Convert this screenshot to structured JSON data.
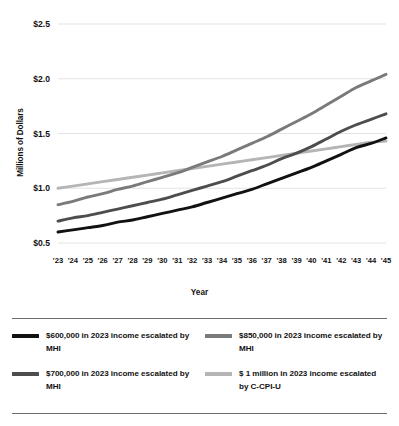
{
  "chart_data": {
    "type": "line",
    "title": "",
    "xlabel": "Year",
    "ylabel": "Millions of Dollars",
    "ylim": [
      0.5,
      2.5
    ],
    "ytick_labels": [
      "$2.5",
      "$2.0",
      "$1.5",
      "$1.0",
      "$0.5"
    ],
    "ytick_values": [
      2.5,
      2.0,
      1.5,
      1.0,
      0.5
    ],
    "grid": "horizontal",
    "legend_position": "bottom",
    "categories": [
      "'23",
      "'24",
      "'25",
      "'26",
      "'27",
      "'28",
      "'29",
      "'30",
      "'31",
      "'32",
      "'33",
      "'34",
      "'35",
      "'36",
      "'37",
      "'38",
      "'39",
      "'40",
      "'41",
      "'42",
      "'43",
      "'44",
      "'45"
    ],
    "x": [
      2023,
      2024,
      2025,
      2026,
      2027,
      2028,
      2029,
      2030,
      2031,
      2032,
      2033,
      2034,
      2035,
      2036,
      2037,
      2038,
      2039,
      2040,
      2041,
      2042,
      2043,
      2044,
      2045
    ],
    "series": [
      {
        "name": "$600,000 in 2023 income escalated by MHI",
        "color": "#111111",
        "values": [
          0.6,
          0.62,
          0.64,
          0.66,
          0.69,
          0.71,
          0.74,
          0.77,
          0.8,
          0.83,
          0.87,
          0.91,
          0.95,
          0.99,
          1.04,
          1.09,
          1.14,
          1.19,
          1.25,
          1.31,
          1.37,
          1.41,
          1.46
        ]
      },
      {
        "name": "$700,000 in 2023 income escalated by MHI",
        "color": "#4d4d4d",
        "values": [
          0.7,
          0.73,
          0.75,
          0.78,
          0.81,
          0.84,
          0.87,
          0.9,
          0.94,
          0.98,
          1.02,
          1.06,
          1.11,
          1.16,
          1.21,
          1.27,
          1.32,
          1.38,
          1.45,
          1.52,
          1.58,
          1.63,
          1.68
        ]
      },
      {
        "name": "$850,000 in 2023 income escalated by MHI",
        "color": "#7a7a7a",
        "values": [
          0.85,
          0.88,
          0.92,
          0.95,
          0.99,
          1.02,
          1.06,
          1.1,
          1.14,
          1.19,
          1.24,
          1.29,
          1.35,
          1.41,
          1.47,
          1.54,
          1.61,
          1.68,
          1.76,
          1.84,
          1.92,
          1.98,
          2.04
        ]
      },
      {
        "name": "$ 1 million in 2023 income escalated by C-CPI-U",
        "color": "#b5b5b5",
        "values": [
          1.0,
          1.02,
          1.04,
          1.06,
          1.08,
          1.1,
          1.12,
          1.14,
          1.16,
          1.18,
          1.2,
          1.22,
          1.24,
          1.26,
          1.28,
          1.3,
          1.32,
          1.34,
          1.36,
          1.38,
          1.4,
          1.42,
          1.43
        ]
      }
    ]
  },
  "legend": {
    "items": [
      {
        "label": "$600,000 in 2023 income escalated by MHI",
        "color": "#111111"
      },
      {
        "label": "$850,000 in 2023 income escalated by MHI",
        "color": "#7a7a7a"
      },
      {
        "label": "$700,000 in 2023 income escalated by MHI",
        "color": "#4d4d4d"
      },
      {
        "label": "$ 1 million in 2023 income escalated by C-CPI-U",
        "color": "#b5b5b5"
      }
    ]
  }
}
